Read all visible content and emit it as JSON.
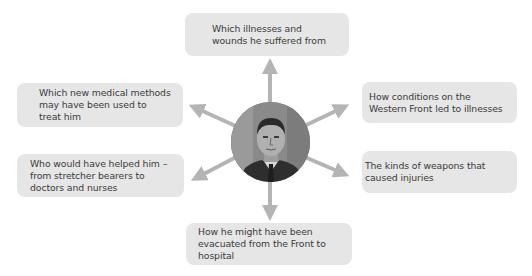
{
  "diagram": {
    "type": "spider-diagram",
    "center": {
      "label": "portrait-photo",
      "description": "Black and white photograph of a man in a suit and tie"
    },
    "nodes": [
      {
        "id": "top",
        "text": "Which illnesses and wounds he suffered from"
      },
      {
        "id": "left-top",
        "text": "Which new medical methods may have been used to treat him"
      },
      {
        "id": "right-top",
        "text": "How conditions on the Western Front led to illnesses"
      },
      {
        "id": "left-bottom",
        "text": "Who would have helped him – from stretcher bearers to doctors and nurses"
      },
      {
        "id": "right-bottom",
        "text": "The kinds of weapons that caused injuries"
      },
      {
        "id": "bottom",
        "text": "How he might have been evacuated from the Front to hospital"
      }
    ],
    "colors": {
      "box_fill": "#e6e6e6",
      "arrow": "#b4b4b4",
      "text": "#3a3a3a"
    }
  }
}
